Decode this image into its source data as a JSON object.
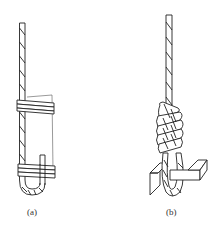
{
  "figure": {
    "panels": [
      {
        "id": "a",
        "label": "(a)",
        "description": "rope end bent back into a loop and seized with two wire wrappings along a board/backing piece"
      },
      {
        "id": "b",
        "label": "(b)",
        "description": "rope end wrapped in a coiled whipping around a loop passing through a block/thimble"
      }
    ]
  },
  "colors": {
    "stroke": "#222222",
    "background": "#ffffff"
  }
}
